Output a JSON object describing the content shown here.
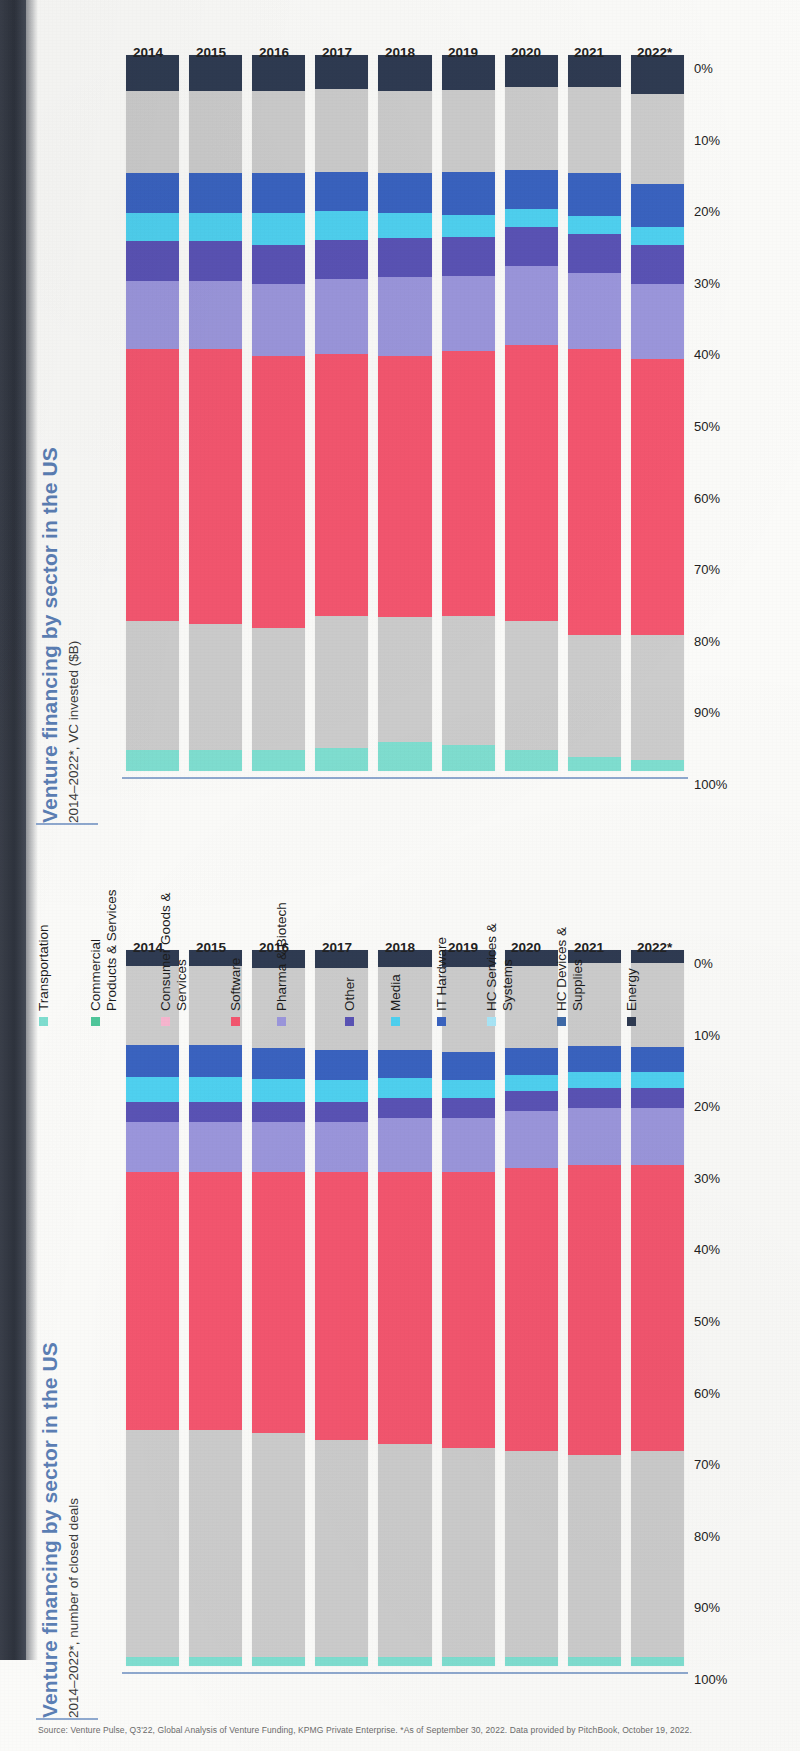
{
  "source_note": "Source: Venture Pulse, Q3'22, Global Analysis of Venture Funding, KPMG Private Enterprise. *As of September 30, 2022. Data provided by PitchBook, October 19, 2022.",
  "legend": {
    "items": [
      {
        "label": "Transportation",
        "color": "#7fded0"
      },
      {
        "label": "Commercial\nProducts & Services",
        "color": "#4fc79a"
      },
      {
        "label": "Consumer Goods &\nServices",
        "color": "#f7b6cf"
      },
      {
        "label": "Software",
        "color": "#f4566f"
      },
      {
        "label": "Pharma & Biotech",
        "color": "#9b96dc"
      },
      {
        "label": "Other",
        "color": "#5a53b5"
      },
      {
        "label": "Media",
        "color": "#4fd1f0"
      },
      {
        "label": "IT Hardware",
        "color": "#3a63c0"
      },
      {
        "label": "HC Services &\nSystems",
        "color": "#a9e6f7"
      },
      {
        "label": "HC Devices &\nSupplies",
        "color": "#3f6aa8"
      },
      {
        "label": "Energy",
        "color": "#2f3b52"
      }
    ]
  },
  "y_ticks": [
    "100%",
    "90%",
    "80%",
    "70%",
    "60%",
    "50%",
    "40%",
    "30%",
    "20%",
    "10%",
    "0%"
  ],
  "chart_data": [
    {
      "id": "vc_invested",
      "type": "bar",
      "stacked": "percent",
      "title": "Venture financing by sector in the US",
      "subtitle": "2014–2022*, VC invested ($B)",
      "xlabel": "",
      "ylabel": "",
      "ylim": [
        0,
        100
      ],
      "grid": false,
      "legend_position": "center",
      "categories": [
        "2014",
        "2015",
        "2016",
        "2017",
        "2018",
        "2019",
        "2020",
        "2021",
        "2022*"
      ],
      "series": [
        {
          "name": "Transportation",
          "values": [
            3.0,
            3.0,
            3.0,
            3.2,
            4.0,
            3.6,
            3.0,
            2.0,
            1.6
          ]
        },
        {
          "name": "Commercial Products & Services",
          "values": [
            11.5,
            11.0,
            11.0,
            12.5,
            11.0,
            11.0,
            11.5,
            11.0,
            11.4
          ]
        },
        {
          "name": "Consumer Goods & Services",
          "values": [
            6.5,
            6.5,
            6.0,
            6.0,
            6.5,
            7.0,
            6.5,
            6.0,
            6.0
          ]
        },
        {
          "name": "Software",
          "values": [
            38.0,
            38.5,
            38.0,
            36.5,
            36.5,
            37.0,
            38.5,
            40.0,
            38.5
          ]
        },
        {
          "name": "Pharma & Biotech",
          "values": [
            9.5,
            9.5,
            10.0,
            10.5,
            11.0,
            10.5,
            11.0,
            10.5,
            10.5
          ]
        },
        {
          "name": "Other",
          "values": [
            5.5,
            5.5,
            5.5,
            5.5,
            5.5,
            5.5,
            5.5,
            5.5,
            5.5
          ]
        },
        {
          "name": "Media",
          "values": [
            4.0,
            4.0,
            4.5,
            4.0,
            3.5,
            3.0,
            2.5,
            2.5,
            2.5
          ]
        },
        {
          "name": "IT Hardware",
          "values": [
            5.5,
            5.5,
            5.5,
            5.5,
            5.5,
            6.0,
            5.5,
            6.0,
            6.0
          ]
        },
        {
          "name": "HC Services & Systems",
          "values": [
            4.5,
            4.5,
            4.5,
            4.5,
            4.5,
            4.5,
            5.0,
            5.5,
            5.5
          ]
        },
        {
          "name": "HC Devices & Supplies",
          "values": [
            7.0,
            7.0,
            7.0,
            7.0,
            7.0,
            7.0,
            6.5,
            6.5,
            7.0
          ]
        },
        {
          "name": "Energy",
          "values": [
            5.0,
            5.0,
            5.0,
            4.8,
            5.0,
            4.9,
            4.5,
            4.5,
            5.5
          ]
        }
      ]
    },
    {
      "id": "closed_deals",
      "type": "bar",
      "stacked": "percent",
      "title": "Venture financing by sector in the US",
      "subtitle": "2014–2022*, number of closed deals",
      "xlabel": "",
      "ylabel": "",
      "ylim": [
        0,
        100
      ],
      "grid": false,
      "legend_position": "center",
      "categories": [
        "2014",
        "2015",
        "2016",
        "2017",
        "2018",
        "2019",
        "2020",
        "2021",
        "2022*"
      ],
      "series": [
        {
          "name": "Transportation",
          "values": [
            1.2,
            1.2,
            1.2,
            1.2,
            1.2,
            1.2,
            1.2,
            1.2,
            1.2
          ]
        },
        {
          "name": "Commercial Products & Services",
          "values": [
            14.8,
            14.8,
            14.8,
            14.3,
            14.3,
            14.3,
            14.3,
            14.3,
            15.3
          ]
        },
        {
          "name": "Consumer Goods & Services",
          "values": [
            17.0,
            17.0,
            16.5,
            16.0,
            15.5,
            15.0,
            14.5,
            14.0,
            13.5
          ]
        },
        {
          "name": "Software",
          "values": [
            36.0,
            36.0,
            36.5,
            37.5,
            38.0,
            38.5,
            39.5,
            40.5,
            40.0
          ]
        },
        {
          "name": "Pharma & Biotech",
          "values": [
            7.0,
            7.0,
            7.0,
            7.0,
            7.5,
            7.5,
            8.0,
            8.0,
            8.0
          ]
        },
        {
          "name": "Other",
          "values": [
            2.8,
            2.8,
            2.8,
            2.8,
            2.8,
            2.8,
            2.8,
            2.8,
            2.8
          ]
        },
        {
          "name": "Media",
          "values": [
            3.5,
            3.5,
            3.2,
            3.0,
            2.8,
            2.5,
            2.2,
            2.2,
            2.2
          ]
        },
        {
          "name": "IT Hardware",
          "values": [
            4.5,
            4.5,
            4.3,
            4.2,
            4.0,
            4.0,
            3.8,
            3.6,
            3.5
          ]
        },
        {
          "name": "HC Services & Systems",
          "values": [
            6.0,
            6.0,
            6.2,
            6.3,
            6.5,
            6.8,
            7.0,
            7.2,
            7.3
          ]
        },
        {
          "name": "HC Devices & Supplies",
          "values": [
            5.0,
            5.0,
            5.0,
            5.2,
            5.0,
            5.0,
            4.5,
            4.4,
            4.4
          ]
        },
        {
          "name": "Energy",
          "values": [
            2.2,
            2.2,
            2.5,
            2.5,
            2.4,
            2.4,
            2.2,
            1.8,
            1.8
          ]
        }
      ]
    }
  ]
}
